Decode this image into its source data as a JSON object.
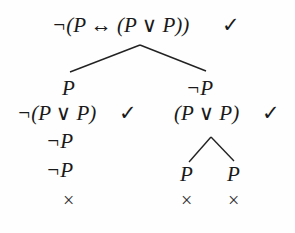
{
  "tree": {
    "root": {
      "formula": "¬(P ↔ (P ∨ P))",
      "checked": true,
      "check_mark": "✓"
    },
    "left_branch": {
      "nodes": [
        {
          "formula": "P"
        },
        {
          "formula": "¬(P ∨ P)",
          "checked": true,
          "check_mark": "✓"
        },
        {
          "formula": "¬P"
        },
        {
          "formula": "¬P"
        }
      ],
      "closed": true,
      "close_mark": "×"
    },
    "right_branch": {
      "nodes": [
        {
          "formula": "¬P"
        },
        {
          "formula": "(P ∨ P)",
          "checked": true,
          "check_mark": "✓"
        }
      ],
      "sub_branches": [
        {
          "formula": "P",
          "closed": true,
          "close_mark": "×"
        },
        {
          "formula": "P",
          "closed": true,
          "close_mark": "×"
        }
      ]
    }
  }
}
